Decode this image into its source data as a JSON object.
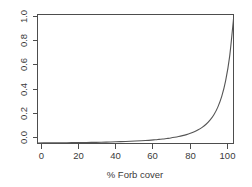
{
  "chart_data": {
    "type": "line",
    "title": "",
    "subtitle": "",
    "xlabel": "% Forb cover",
    "ylabel": "",
    "xlim": [
      0,
      100
    ],
    "ylim": [
      0.0,
      1.0
    ],
    "grid": false,
    "legend": null,
    "x_ticks": [
      {
        "value": 0,
        "label": "0"
      },
      {
        "value": 20,
        "label": "20"
      },
      {
        "value": 40,
        "label": "40"
      },
      {
        "value": 60,
        "label": "60"
      },
      {
        "value": 80,
        "label": "80"
      },
      {
        "value": 100,
        "label": "100"
      }
    ],
    "y_ticks": [
      {
        "value": 0.0,
        "label": "0.0"
      },
      {
        "value": 0.2,
        "label": "0.2"
      },
      {
        "value": 0.4,
        "label": "0.4"
      },
      {
        "value": 0.6,
        "label": "0.6"
      },
      {
        "value": 0.8,
        "label": "0.8"
      },
      {
        "value": 1.0,
        "label": "1.0"
      }
    ],
    "y_tick_label_rotation": -90,
    "series": [
      {
        "name": "predicted probability",
        "color": "#555555",
        "x": [
          0,
          5,
          10,
          15,
          20,
          25,
          30,
          35,
          40,
          45,
          50,
          55,
          60,
          62,
          64,
          66,
          68,
          70,
          72,
          74,
          76,
          78,
          80,
          82,
          84,
          86,
          88,
          90,
          92,
          94,
          96,
          98,
          100
        ],
        "y": [
          0.004,
          0.005,
          0.005,
          0.006,
          0.007,
          0.008,
          0.009,
          0.011,
          0.013,
          0.016,
          0.019,
          0.023,
          0.029,
          0.032,
          0.035,
          0.039,
          0.043,
          0.048,
          0.054,
          0.061,
          0.069,
          0.079,
          0.091,
          0.106,
          0.125,
          0.149,
          0.181,
          0.223,
          0.282,
          0.365,
          0.487,
          0.671,
          0.965
        ]
      }
    ]
  },
  "axes": {
    "x_axis_label": "% Forb cover",
    "y_axis_label": ""
  }
}
